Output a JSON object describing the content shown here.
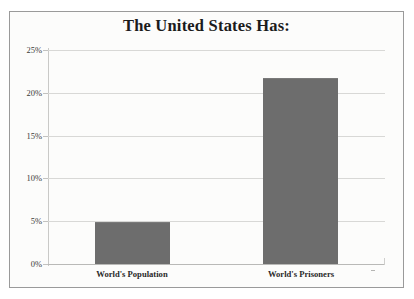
{
  "chart_data": {
    "type": "bar",
    "title": "The United States Has:",
    "subtitle": "",
    "xlabel": "",
    "ylabel": "",
    "categories": [
      "World's Population",
      "World's Prisoners"
    ],
    "values": [
      4.9,
      21.7
    ],
    "value_labels": [
      "",
      ""
    ],
    "ylim": [
      0,
      25
    ],
    "ytick_values": [
      0,
      5,
      10,
      15,
      20,
      25
    ],
    "ytick_labels": [
      "0%",
      "5%",
      "10%",
      "15%",
      "20%",
      "25%"
    ],
    "grid": true,
    "legend": false,
    "legend_position": "none",
    "series": [
      {
        "name": "",
        "values": [
          4.9,
          21.7
        ],
        "color": "#6d6d6d"
      }
    ],
    "colors": {
      "bar_fill": "#6d6d6d",
      "gridline": "#d8d8d6",
      "axis_line": "#c9c9c7",
      "frame_border": "#9a9a9a",
      "plot_background": "#fcfcfb",
      "title_text": "#1b1b1b",
      "tick_text": "#3a3a3a",
      "category_text": "#2a2a2a"
    }
  }
}
